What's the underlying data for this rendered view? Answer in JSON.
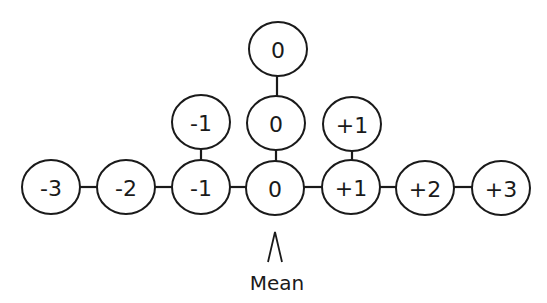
{
  "diagram": {
    "type": "distribution-of-values",
    "nodes": [
      {
        "id": "b0",
        "label": "-3",
        "row": "base"
      },
      {
        "id": "b1",
        "label": "-2",
        "row": "base"
      },
      {
        "id": "b2",
        "label": "-1",
        "row": "base"
      },
      {
        "id": "b3",
        "label": "0",
        "row": "base"
      },
      {
        "id": "b4",
        "label": "+1",
        "row": "base"
      },
      {
        "id": "b5",
        "label": "+2",
        "row": "base"
      },
      {
        "id": "b6",
        "label": "+3",
        "row": "base"
      },
      {
        "id": "m2",
        "label": "-1",
        "row": "middle"
      },
      {
        "id": "m3",
        "label": "0",
        "row": "middle"
      },
      {
        "id": "m4",
        "label": "+1",
        "row": "middle"
      },
      {
        "id": "t3",
        "label": "0",
        "row": "top"
      }
    ],
    "edges": [
      [
        "b0",
        "b1"
      ],
      [
        "b1",
        "b2"
      ],
      [
        "b2",
        "b3"
      ],
      [
        "b3",
        "b4"
      ],
      [
        "b4",
        "b5"
      ],
      [
        "b5",
        "b6"
      ],
      [
        "b2",
        "m2"
      ],
      [
        "b3",
        "m3"
      ],
      [
        "b4",
        "m4"
      ],
      [
        "m3",
        "t3"
      ]
    ],
    "pointer": {
      "label": "Mean",
      "target": "b3"
    }
  }
}
